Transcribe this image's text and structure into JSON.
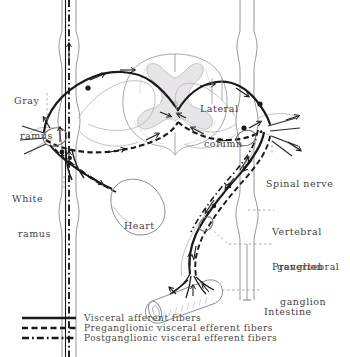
{
  "figure": {
    "kind": "anatomical-diagram",
    "background_color": "#ffffff",
    "ink_color": "#1a1a1a",
    "faint_ink_color": "#9a989a",
    "label_color": "#444244"
  },
  "labels": {
    "gray_ramus": {
      "line1": "Gray",
      "line2": "ramus"
    },
    "white_ramus": {
      "line1": "White",
      "line2": "ramus"
    },
    "lateral_column": {
      "line1": "Lateral",
      "line2": "column"
    },
    "spinal_nerve": {
      "line1": "Spinal nerve"
    },
    "vertebral_ganglion": {
      "line1": "Vertebral",
      "line2": "ganglion"
    },
    "prevertebral_ganglion": {
      "line1": "Prevertebral",
      "line2": "ganglion"
    },
    "intestine": {
      "line1": "Intestine"
    },
    "heart": {
      "line1": "Heart"
    }
  },
  "legend": {
    "items": [
      {
        "style": "solid",
        "label": "Visceral afferent fibers"
      },
      {
        "style": "dashed",
        "label": "Preganglionic visceral efferent fibers"
      },
      {
        "style": "dashdot",
        "label": "Postganglionic visceral efferent fibers"
      }
    ]
  }
}
